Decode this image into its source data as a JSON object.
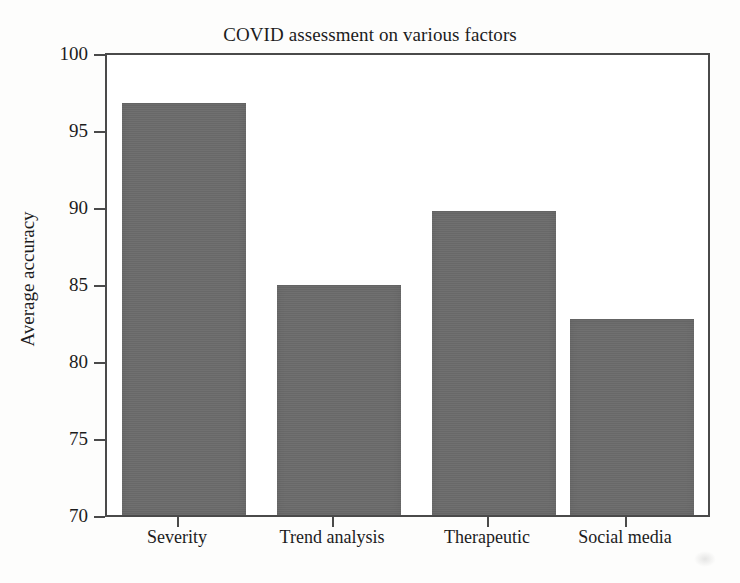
{
  "chart_data": {
    "type": "bar",
    "title": "COVID assessment on various factors",
    "xlabel": "",
    "ylabel": "Average accuracy",
    "categories": [
      "Severity",
      "Trend analysis",
      "Therapeutic",
      "Social media"
    ],
    "values": [
      96.9,
      85.0,
      89.8,
      82.8
    ],
    "ylim": [
      70,
      100
    ],
    "yticks": [
      70,
      75,
      80,
      85,
      90,
      95,
      100
    ],
    "ytick_labels": [
      "70",
      "75",
      "80",
      "85",
      "90",
      "95",
      "100"
    ],
    "grid": false,
    "legend": false,
    "bar_color": "#6b6b6b",
    "axis_color": "#4a4a4a",
    "background": "#ffffff"
  },
  "labels": {
    "tick_y_0": "70",
    "tick_y_1": "75",
    "tick_y_2": "80",
    "tick_y_3": "85",
    "tick_y_4": "90",
    "tick_y_5": "95",
    "tick_y_6": "100",
    "cat_0": "Severity",
    "cat_1": "Trend analysis",
    "cat_2": "Therapeutic",
    "cat_3": "Social media"
  }
}
